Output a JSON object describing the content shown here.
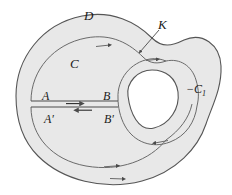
{
  "figure": {
    "type": "mathematical-diagram",
    "fill_color": "#e8e8e8",
    "stroke_color": "#555555",
    "background_color": "#ffffff",
    "width": 232,
    "height": 195
  },
  "labels": {
    "domain": "D",
    "outer_boundary": "K",
    "outer_contour": "C",
    "inner_contour": "−C",
    "inner_contour_subscript": "1",
    "cut_start_top": "A",
    "cut_end_top": "B",
    "cut_start_bottom": "A",
    "cut_end_bottom": "B",
    "prime": "′"
  },
  "arrows": {
    "cut_top_direction": "right",
    "cut_bottom_direction": "left",
    "contour_C_top": "right",
    "contour_C_bottom": "right",
    "contour_C1_top": "right",
    "contour_C1_bottom": "left",
    "outer_K_bottom": "right"
  }
}
